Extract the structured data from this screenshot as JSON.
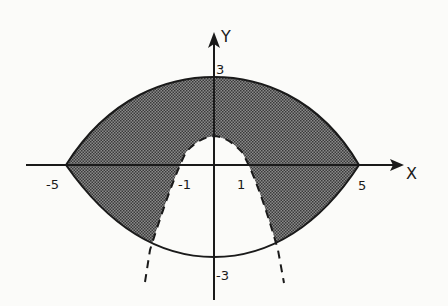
{
  "diagram": {
    "axes": {
      "x_label": "X",
      "y_label": "Y"
    },
    "tick_labels": {
      "x_neg5": "-5",
      "x_neg1": "-1",
      "x_pos1": "1",
      "x_pos5": "5",
      "y_pos3": "3",
      "y_neg3": "-3"
    },
    "region": {
      "description": "Shaded region inside the lens-shaped boundary (through (-5,0), (0,3), (5,0), (0,-3)) and outside the dashed parabola y = 1 - x^2",
      "shade_color": "#5a5a5a"
    },
    "curves": [
      {
        "name": "upper-boundary",
        "style": "solid",
        "through": [
          [
            -5,
            0
          ],
          [
            0,
            3
          ],
          [
            5,
            0
          ]
        ]
      },
      {
        "name": "lower-boundary",
        "style": "solid",
        "through": [
          [
            -5,
            0
          ],
          [
            0,
            -3
          ],
          [
            5,
            0
          ]
        ]
      },
      {
        "name": "parabola",
        "style": "dashed",
        "equation": "y = 1 - x^2",
        "vertex": [
          0,
          1
        ],
        "x_intercepts": [
          -1,
          1
        ]
      }
    ]
  }
}
